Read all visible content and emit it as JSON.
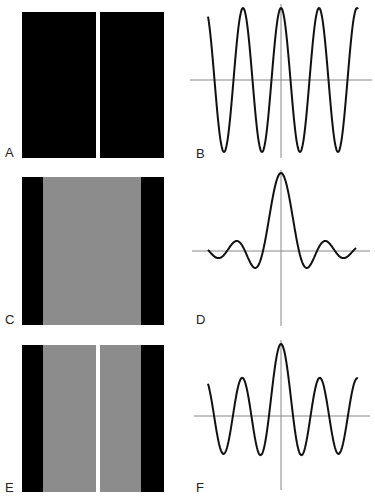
{
  "figure": {
    "panels": [
      {
        "label": "A",
        "type": "image",
        "description": "single narrow slit: white vertical line on black field"
      },
      {
        "label": "B",
        "type": "plot",
        "description": "cosine oscillation (Fourier transform of single slit offset)"
      },
      {
        "label": "C",
        "type": "image",
        "description": "wide gray band on black field"
      },
      {
        "label": "D",
        "type": "plot",
        "description": "sinc function"
      },
      {
        "label": "E",
        "type": "image",
        "description": "gray band with white slit in center"
      },
      {
        "label": "F",
        "type": "plot",
        "description": "cosine plus sinc superposition"
      }
    ]
  },
  "chart_data": [
    {
      "type": "line",
      "title": "B",
      "xlabel": "",
      "ylabel": "",
      "shape": "cos",
      "x": [
        -4,
        -3,
        -2,
        -1,
        0,
        1,
        2,
        3,
        4
      ],
      "values": [
        0.7,
        0.9,
        -1,
        0.9,
        1,
        0.9,
        -1,
        0.9,
        0.7
      ],
      "grid": false
    },
    {
      "type": "line",
      "title": "D",
      "xlabel": "",
      "ylabel": "",
      "shape": "sinc",
      "x": [
        -4,
        -3,
        -2,
        -1,
        0,
        1,
        2,
        3,
        4
      ],
      "values": [
        0.02,
        0.1,
        0.2,
        -0.3,
        1,
        -0.3,
        0.2,
        0.1,
        0.02
      ],
      "grid": false
    },
    {
      "type": "line",
      "title": "F",
      "xlabel": "",
      "ylabel": "",
      "shape": "cos+sinc",
      "x": [
        -4,
        -3,
        -2,
        -1,
        0,
        1,
        2,
        3,
        4
      ],
      "values": [
        0.4,
        0.5,
        -0.5,
        -0.5,
        1,
        -0.5,
        -0.5,
        0.5,
        0.4
      ],
      "grid": false
    }
  ]
}
